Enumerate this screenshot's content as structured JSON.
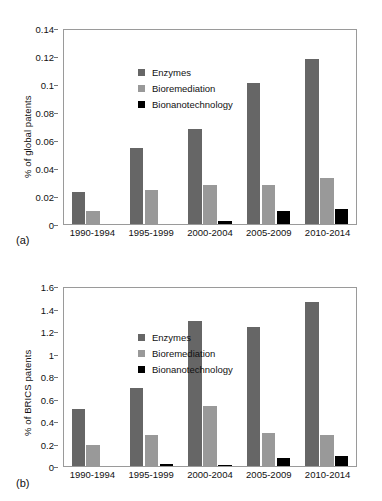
{
  "figure": {
    "background": "#ffffff",
    "panels": [
      "a",
      "b"
    ]
  },
  "colors": {
    "enzymes": "#666666",
    "bioremediation": "#999999",
    "bionanotechnology": "#000000",
    "axis": "#9a9a9a",
    "text": "#111111"
  },
  "panel_a": {
    "tag": "(a)",
    "legend": [
      {
        "label": "Enzymes",
        "color": "#666666",
        "swatch": "legend-swatch-enzymes"
      },
      {
        "label": "Bioremediation",
        "color": "#999999",
        "swatch": "legend-swatch-bioremediation"
      },
      {
        "label": "Bionanotechnology",
        "color": "#000000",
        "swatch": "legend-swatch-bionanotechnology"
      }
    ]
  },
  "panel_b": {
    "tag": "(b)",
    "legend": [
      {
        "label": "Enzymes",
        "color": "#666666",
        "swatch": "legend-swatch-enzymes"
      },
      {
        "label": "Bioremediation",
        "color": "#999999",
        "swatch": "legend-swatch-bioremediation"
      },
      {
        "label": "Bionanotechnology",
        "color": "#000000",
        "swatch": "legend-swatch-bionanotechnology"
      }
    ]
  },
  "chart_data": [
    {
      "id": "panel-a",
      "type": "bar",
      "title": "",
      "panel_label": "(a)",
      "xlabel": "",
      "ylabel": "% of global patents",
      "categories": [
        "1990-1994",
        "1995-1999",
        "2000-2004",
        "2005-2009",
        "2010-2014"
      ],
      "series": [
        {
          "name": "Enzymes",
          "color": "#666666",
          "values": [
            0.023,
            0.054,
            0.068,
            0.101,
            0.118
          ]
        },
        {
          "name": "Bioremediation",
          "color": "#999999",
          "values": [
            0.0095,
            0.0245,
            0.028,
            0.028,
            0.033
          ]
        },
        {
          "name": "Bionanotechnology",
          "color": "#000000",
          "values": [
            0,
            0,
            0.002,
            0.009,
            0.011
          ]
        }
      ],
      "ylim": [
        0,
        0.14
      ],
      "yticks": [
        0,
        0.02,
        0.04,
        0.06,
        0.08,
        0.1,
        0.12,
        0.14
      ],
      "ytick_labels": [
        "0",
        "0.02",
        "0.04",
        "0.06",
        "0.08",
        "0.1",
        "0.12",
        "0.14"
      ],
      "grid": false,
      "legend_position": "top-left"
    },
    {
      "id": "panel-b",
      "type": "bar",
      "title": "",
      "panel_label": "(b)",
      "xlabel": "",
      "ylabel": "% of BRICS patents",
      "categories": [
        "1990-1994",
        "1995-1999",
        "2000-2004",
        "2005-2009",
        "2010-2014"
      ],
      "series": [
        {
          "name": "Enzymes",
          "color": "#666666",
          "values": [
            0.51,
            0.69,
            1.29,
            1.24,
            1.46
          ]
        },
        {
          "name": "Bioremediation",
          "color": "#999999",
          "values": [
            0.19,
            0.275,
            0.535,
            0.295,
            0.275
          ]
        },
        {
          "name": "Bionanotechnology",
          "color": "#000000",
          "values": [
            0,
            0.018,
            0.012,
            0.068,
            0.09
          ]
        }
      ],
      "ylim": [
        0,
        1.6
      ],
      "yticks": [
        0,
        0.2,
        0.4,
        0.6,
        0.8,
        1,
        1.2,
        1.4,
        1.6
      ],
      "ytick_labels": [
        "0",
        "0.2",
        "0.4",
        "0.6",
        "0.8",
        "1",
        "1.2",
        "1.4",
        "1.6"
      ],
      "grid": false,
      "legend_position": "top-left"
    }
  ]
}
